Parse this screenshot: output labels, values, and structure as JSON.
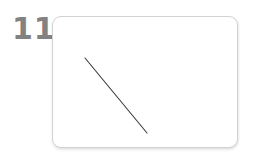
{
  "figure": {
    "step_label": "11",
    "step_label_color": "#828282",
    "background_color": "#ffffff"
  },
  "card": {
    "name": "drawing-card",
    "fill_color": "#ffffff",
    "border_color": "#d2d2d2",
    "corner_radius": 9,
    "x": 52,
    "y": 16,
    "width": 186,
    "height": 132,
    "shadow": "subtle drop shadow"
  },
  "drawing": {
    "type": "diagonal-line",
    "stroke_color": "#3a3a3a",
    "stroke_width": 1.1,
    "start_x": 85,
    "start_y": 58,
    "end_x": 147,
    "end_y": 133
  }
}
